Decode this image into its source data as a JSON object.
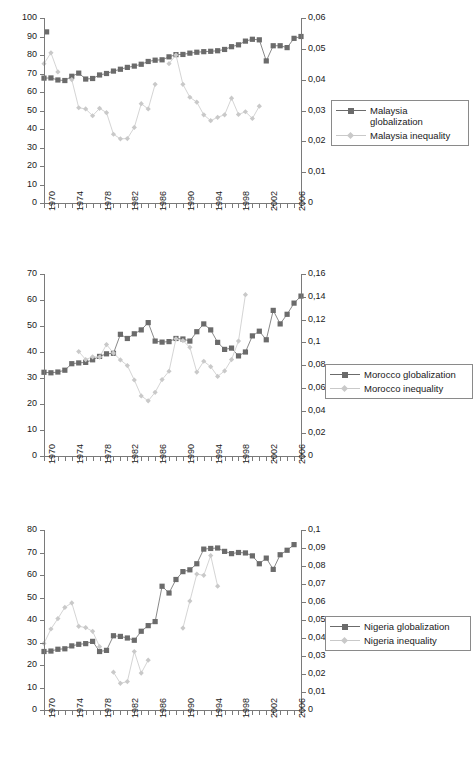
{
  "page_header": {
    "center": "",
    "right": ""
  },
  "figure": {
    "series_colors": {
      "globalization": "#6b6b6b",
      "inequality": "#c9c9c9",
      "axis": "#7a7a7a",
      "text": "#1a1a1a",
      "background": "#ffffff"
    },
    "x_axis": {
      "label_years": [
        "1970",
        "1974",
        "1978",
        "1982",
        "1986",
        "1990",
        "1994",
        "1998",
        "2002",
        "2006"
      ],
      "tick_start": 1970,
      "tick_end": 2007,
      "tick_step": 1,
      "label_step": 4
    }
  },
  "chart_data": [
    {
      "type": "line",
      "title": "",
      "panel": "malaysia",
      "xlabel": "",
      "ylabel": "",
      "grid": false,
      "legend_position": "right",
      "x": [
        1970,
        1971,
        1972,
        1973,
        1974,
        1975,
        1976,
        1977,
        1978,
        1979,
        1980,
        1981,
        1982,
        1983,
        1984,
        1985,
        1986,
        1987,
        1988,
        1989,
        1990,
        1991,
        1992,
        1993,
        1994,
        1995,
        1996,
        1997,
        1998,
        1999,
        2000,
        2001,
        2002,
        2003,
        2004,
        2005,
        2006,
        2007
      ],
      "left_axis": {
        "ticks": [
          "0",
          "10",
          "20",
          "30",
          "40",
          "50",
          "60",
          "70",
          "80",
          "90",
          "100"
        ],
        "ylim": [
          0,
          100
        ],
        "step": 10
      },
      "right_axis": {
        "ticks": [
          "0",
          "0,01",
          "0,02",
          "0,03",
          "0,04",
          "0,05",
          "0,06"
        ],
        "ylim": [
          0,
          0.06
        ],
        "step": 0.01
      },
      "series": [
        {
          "name": "Malaysia globalization",
          "marker": "square",
          "color": "#6b6b6b",
          "axis": "left",
          "values": [
            67.5,
            67.6,
            66.5,
            66.2,
            68.5,
            70.2,
            67.0,
            67.3,
            69.2,
            70.0,
            71.3,
            72.3,
            73.3,
            74.0,
            75.0,
            76.5,
            77.2,
            77.4,
            79.0,
            80.2,
            80.3,
            81.0,
            81.5,
            81.8,
            82.0,
            82.3,
            83.0,
            84.5,
            85.5,
            87.5,
            88.5,
            88.2,
            76.8,
            85.0,
            85.0,
            84.0,
            89.0,
            90.0,
            92.5
          ]
        },
        {
          "name": "Malaysia inequality",
          "marker": "diamond",
          "color": "#c9c9c9",
          "axis": "right",
          "values": [
            0.0452,
            0.0487,
            0.0425,
            null,
            0.04,
            0.0309,
            0.0305,
            0.0283,
            0.0307,
            0.0293,
            0.0223,
            0.0208,
            0.0209,
            0.0245,
            0.0322,
            0.0305,
            0.0385,
            null,
            0.0452,
            0.048,
            0.0385,
            0.0343,
            0.0327,
            0.0286,
            0.0267,
            0.0278,
            0.0286,
            0.034,
            0.0287,
            0.0296,
            0.0274,
            0.0314,
            null,
            null,
            null,
            null,
            null,
            null
          ]
        }
      ]
    },
    {
      "type": "line",
      "title": "",
      "panel": "morocco",
      "xlabel": "",
      "ylabel": "",
      "grid": false,
      "legend_position": "right",
      "x": [
        1970,
        1971,
        1972,
        1973,
        1974,
        1975,
        1976,
        1977,
        1978,
        1979,
        1980,
        1981,
        1982,
        1983,
        1984,
        1985,
        1986,
        1987,
        1988,
        1989,
        1990,
        1991,
        1992,
        1993,
        1994,
        1995,
        1996,
        1997,
        1998,
        1999,
        2000,
        2001,
        2002,
        2003,
        2004,
        2005,
        2006,
        2007
      ],
      "left_axis": {
        "ticks": [
          "0",
          "10",
          "20",
          "30",
          "40",
          "50",
          "60",
          "70"
        ],
        "ylim": [
          0,
          70
        ],
        "step": 10
      },
      "right_axis": {
        "ticks": [
          "0",
          "0,02",
          "0,04",
          "0,06",
          "0,08",
          "0,1",
          "0,12",
          "0,14",
          "0,16"
        ],
        "ylim": [
          0,
          0.16
        ],
        "step": 0.02
      },
      "series": [
        {
          "name": "Morocco globalization",
          "marker": "square",
          "color": "#6b6b6b",
          "axis": "left",
          "values": [
            32.2,
            32.0,
            32.3,
            33.0,
            35.5,
            35.8,
            36.0,
            37.0,
            38.3,
            39.3,
            39.5,
            46.8,
            45.2,
            47.0,
            48.5,
            51.3,
            44.2,
            43.8,
            44.0,
            45.2,
            45.0,
            44.2,
            47.8,
            50.8,
            48.5,
            43.7,
            41.0,
            41.5,
            38.5,
            40.0,
            46.2,
            48.0,
            44.7,
            56.0,
            50.8,
            54.5,
            58.8,
            61.5
          ]
        },
        {
          "name": "Morocco inequality",
          "marker": "diamond",
          "color": "#c9c9c9",
          "axis": "right",
          "values": [
            null,
            null,
            null,
            null,
            null,
            0.0918,
            0.0848,
            0.0872,
            0.087,
            0.098,
            0.0905,
            0.0845,
            0.0795,
            0.0668,
            0.0528,
            0.0485,
            0.056,
            0.0672,
            0.0745,
            0.103,
            0.1015,
            0.0955,
            0.0738,
            0.0833,
            0.0785,
            0.07,
            0.0748,
            0.0848,
            0.101,
            0.1418,
            null,
            null,
            null,
            null,
            null,
            null,
            null,
            null
          ]
        }
      ]
    },
    {
      "type": "line",
      "title": "",
      "panel": "nigeria",
      "xlabel": "",
      "ylabel": "",
      "grid": false,
      "legend_position": "right",
      "x": [
        1970,
        1971,
        1972,
        1973,
        1974,
        1975,
        1976,
        1977,
        1978,
        1979,
        1980,
        1981,
        1982,
        1983,
        1984,
        1985,
        1986,
        1987,
        1988,
        1989,
        1990,
        1991,
        1992,
        1993,
        1994,
        1995,
        1996,
        1997,
        1998,
        1999,
        2000,
        2001,
        2002,
        2003,
        2004,
        2005,
        2006,
        2007
      ],
      "left_axis": {
        "ticks": [
          "0",
          "10",
          "20",
          "30",
          "40",
          "50",
          "60",
          "70",
          "80"
        ],
        "ylim": [
          0,
          80
        ],
        "step": 10
      },
      "right_axis": {
        "ticks": [
          "0",
          "0,01",
          "0,02",
          "0,03",
          "0,04",
          "0,05",
          "0,06",
          "0,07",
          "0,08",
          "0,09",
          "0,1"
        ],
        "ylim": [
          0,
          0.1
        ],
        "step": 0.01
      },
      "series": [
        {
          "name": "Nigeria globalization",
          "marker": "square",
          "color": "#6b6b6b",
          "axis": "left",
          "values": [
            26.0,
            26.2,
            27.0,
            27.2,
            28.5,
            29.2,
            29.5,
            30.5,
            26.0,
            26.5,
            33.0,
            32.7,
            32.0,
            31.0,
            35.0,
            37.5,
            39.3,
            55.0,
            52.0,
            58.0,
            61.5,
            62.3,
            65.0,
            71.5,
            71.8,
            72.0,
            70.5,
            69.5,
            70.0,
            69.8,
            68.5,
            65.0,
            67.5,
            62.5,
            69.0,
            71.0,
            73.5
          ]
        },
        {
          "name": "Nigeria inequality",
          "marker": "diamond",
          "color": "#c9c9c9",
          "axis": "right",
          "values": [
            0.037,
            0.045,
            0.0508,
            0.057,
            0.0595,
            0.0465,
            0.0458,
            0.0437,
            0.0352,
            null,
            0.021,
            0.0148,
            0.0158,
            0.0325,
            0.0205,
            0.0277,
            null,
            null,
            null,
            null,
            0.0455,
            0.0605,
            0.0755,
            0.0748,
            0.0858,
            0.0688,
            null,
            null,
            null,
            null,
            null,
            null,
            null,
            null,
            null,
            null,
            null,
            null
          ]
        }
      ]
    }
  ],
  "legends": [
    {
      "panel": "malaysia",
      "entries": [
        {
          "label": "Malaysia\nglobalization",
          "marker": "square",
          "color": "#6b6b6b"
        },
        {
          "label": "Malaysia inequality",
          "marker": "diamond",
          "color": "#c9c9c9"
        }
      ]
    },
    {
      "panel": "morocco",
      "entries": [
        {
          "label": "Morocco globalization",
          "marker": "square",
          "color": "#6b6b6b"
        },
        {
          "label": "Morocco inequality",
          "marker": "diamond",
          "color": "#c9c9c9"
        }
      ]
    },
    {
      "panel": "nigeria",
      "entries": [
        {
          "label": "Nigeria globalization",
          "marker": "square",
          "color": "#6b6b6b"
        },
        {
          "label": "Nigeria inequality",
          "marker": "diamond",
          "color": "#c9c9c9"
        }
      ]
    }
  ]
}
